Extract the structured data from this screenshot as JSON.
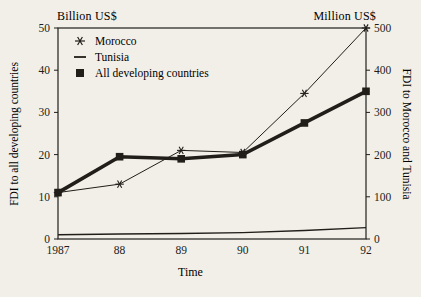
{
  "figure": {
    "bg_color": "#f2efe8",
    "ink_color": "#211e1a"
  },
  "chart_data": {
    "type": "line",
    "x_tick_labels": [
      "1987",
      "88",
      "89",
      "90",
      "91",
      "92"
    ],
    "xlabel": "Time",
    "grid": false,
    "legend_position": "top-left-inside",
    "left_axis": {
      "title": "Billion US$",
      "label": "FDI to all developing countries",
      "range": [
        0,
        50
      ],
      "ticks": [
        0,
        10,
        20,
        30,
        40,
        50
      ]
    },
    "right_axis": {
      "title": "Million US$",
      "label": "FDI to Morocco and Tunisia",
      "range": [
        0,
        500
      ],
      "ticks": [
        0,
        100,
        200,
        300,
        400,
        500
      ]
    },
    "series": [
      {
        "name": "Morocco",
        "axis": "right",
        "marker": "star",
        "line_width": 1,
        "values": [
          110,
          130,
          210,
          205,
          345,
          500
        ]
      },
      {
        "name": "Tunisia",
        "axis": "right",
        "marker": "none",
        "line_width": 1.4,
        "values": [
          10,
          12,
          13,
          15,
          20,
          27
        ]
      },
      {
        "name": "All developing countries",
        "axis": "left",
        "marker": "square",
        "line_width": 3.6,
        "values": [
          11,
          19.5,
          19,
          20,
          27.5,
          35
        ]
      }
    ]
  }
}
